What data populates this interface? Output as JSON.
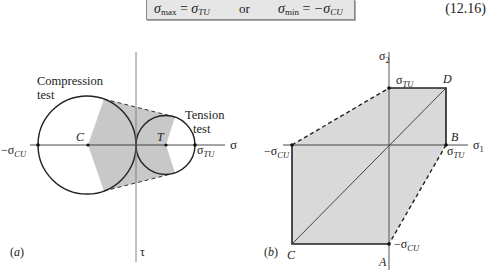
{
  "equation": {
    "lhs_symbol": "σ",
    "lhs_sub": "max",
    "equals": "=",
    "rhs1_symbol": "σ",
    "rhs1_sub": "TU",
    "connector": "or",
    "lhs2_symbol": "σ",
    "lhs2_sub": "min",
    "rhs2_symbol": "−σ",
    "rhs2_sub": "CU",
    "number": "(12.16)"
  },
  "panel_a": {
    "label": "(a)",
    "x_axis_label": "σ",
    "y_axis_label": "τ",
    "compression_label_line1": "Compression",
    "compression_label_line2": "test",
    "tension_label_line1": "Tension",
    "tension_label_line2": "test",
    "center_c": "C",
    "center_t": "T",
    "left_point": "−σ",
    "left_point_sub": "CU",
    "right_point": "σ",
    "right_point_sub": "TU"
  },
  "panel_b": {
    "label": "(b)",
    "x_axis_label": "σ",
    "x_axis_sub": "1",
    "y_axis_label": "σ",
    "y_axis_sub": "2",
    "top_value": "σ",
    "top_value_sub": "TU",
    "right_value": "σ",
    "right_value_sub": "TU",
    "left_value": "−σ",
    "left_value_sub": "CU",
    "bottom_value": "−σ",
    "bottom_value_sub": "CU",
    "corner_a": "A",
    "corner_b": "B",
    "corner_c": "C",
    "corner_d": "D"
  },
  "colors": {
    "shade": "#c8c8c8",
    "shade_light": "#d9d9d9",
    "line": "#222222",
    "axis": "#555555",
    "equation_bg": "#e6e6e6"
  }
}
